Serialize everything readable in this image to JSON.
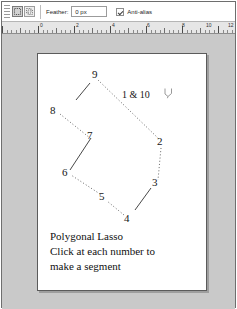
{
  "app": {
    "title": "Polygonal Lasso tool options"
  },
  "optionsbar": {
    "grip_name": "toolbar-grip",
    "mode_buttons": [
      {
        "name": "new-selection-button",
        "icon": "new-selection-icon",
        "active": true
      },
      {
        "name": "add-to-selection-button",
        "icon": "add-to-selection-icon",
        "active": false
      }
    ],
    "feather": {
      "label": "Feather:",
      "value": "0 px",
      "placeholder": "0 px"
    },
    "antialias": {
      "label": "Anti-alias",
      "checked": true
    }
  },
  "ruler": {
    "unit": "inches",
    "labels": [
      "0",
      "2",
      "4",
      "6",
      "8",
      "10",
      "12"
    ],
    "label_positions": [
      36,
      72,
      108,
      143,
      178,
      202,
      224
    ],
    "major_step": 36,
    "origin_x": 36
  },
  "canvas": {
    "background": "#ffffff",
    "border_color": "#5b5b5b",
    "cursor_icon": "polygonal-lasso-cursor-icon",
    "points": [
      {
        "label": "1 & 10",
        "x": 96,
        "y": 41,
        "lx": 84,
        "ly": 35,
        "wide": true
      },
      {
        "label": "2",
        "x": 122,
        "y": 90,
        "lx": 119,
        "ly": 82,
        "wide": false
      },
      {
        "label": "3",
        "x": 118,
        "y": 130,
        "lx": 114,
        "ly": 123,
        "wide": false
      },
      {
        "label": "4",
        "x": 90,
        "y": 165,
        "lx": 86,
        "ly": 159,
        "wide": false
      },
      {
        "label": "5",
        "x": 66,
        "y": 143,
        "lx": 61,
        "ly": 137,
        "wide": false
      },
      {
        "label": "6",
        "x": 29,
        "y": 119,
        "lx": 24,
        "ly": 113,
        "wide": false
      },
      {
        "label": "7",
        "x": 52,
        "y": 82,
        "lx": 49,
        "ly": 76,
        "wide": false
      },
      {
        "label": "8",
        "x": 18,
        "y": 57,
        "lx": 12,
        "ly": 51,
        "wide": false
      },
      {
        "label": "9",
        "x": 58,
        "y": 22,
        "lx": 54,
        "ly": 15,
        "wide": false
      }
    ],
    "segments_dotted": [
      {
        "from": "9",
        "to": "2",
        "x1": 60,
        "y1": 26,
        "x2": 122,
        "y2": 86
      },
      {
        "from": "2",
        "to": "3",
        "x1": 123,
        "y1": 94,
        "x2": 120,
        "y2": 126
      },
      {
        "from": "4",
        "to": "5",
        "x1": 86,
        "y1": 161,
        "x2": 69,
        "y2": 147
      },
      {
        "from": "5",
        "to": "6",
        "x1": 62,
        "y1": 140,
        "x2": 33,
        "y2": 121
      },
      {
        "from": "8",
        "to": "7",
        "x1": 22,
        "y1": 60,
        "x2": 52,
        "y2": 84
      }
    ],
    "segments_solid": [
      {
        "from": "3",
        "to": "4",
        "x1": 113,
        "y1": 134,
        "x2": 97,
        "y2": 156
      },
      {
        "from": "6",
        "to": "7",
        "x1": 32,
        "y1": 116,
        "x2": 53,
        "y2": 84
      },
      {
        "from": "9",
        "to": "8",
        "x1": 52,
        "y1": 29,
        "x2": 38,
        "y2": 46
      }
    ],
    "caption_lines": [
      "Polygonal Lasso",
      "Click at each number to",
      "make a segment"
    ]
  },
  "colors": {
    "workspace_bg": "#c9c9c9",
    "canvas_bg": "#ffffff",
    "ink": "#151515",
    "ruler_bg": "#e6e6e6"
  }
}
